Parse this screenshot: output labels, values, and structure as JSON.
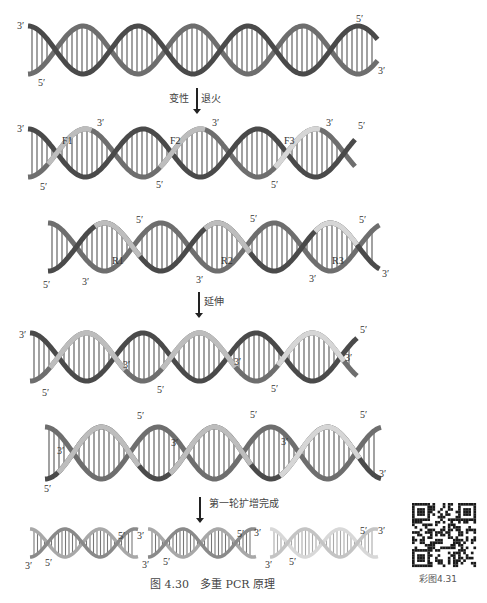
{
  "figure": {
    "caption": "图 4.30　多重 PCR 原理",
    "qr_label": "彩图4.31"
  },
  "steps": [
    {
      "left": "变性",
      "right": "退火"
    },
    {
      "right": "延伸"
    },
    {
      "right": "第一轮扩增完成"
    }
  ],
  "colors": {
    "strand_dark": "#4a4a4a",
    "strand_mid": "#6e6e6e",
    "primer_light": "#bdbdbd",
    "primer_lighter": "#d6d6d6",
    "rung": "#555555"
  },
  "panels": {
    "p1": {
      "labels": [
        "3′",
        "5′",
        "5′",
        "3′"
      ]
    },
    "p2": {
      "labels": [
        "3′",
        "5′",
        "F1",
        "3′",
        "5′",
        "F2",
        "3′",
        "5′",
        "F3",
        "3′",
        "5′"
      ]
    },
    "p3": {
      "labels": [
        "5′",
        "3′",
        "R1",
        "5′",
        "3′",
        "R2",
        "5′",
        "3′",
        "R3",
        "5′",
        "3′"
      ]
    },
    "p4": {
      "labels": [
        "3′",
        "5′",
        "3′",
        "5′",
        "3′",
        "5′",
        "3′",
        "5′"
      ]
    },
    "p5": {
      "labels": [
        "3′",
        "5′",
        "5′",
        "3′",
        "5′",
        "3′",
        "5′",
        "3′"
      ]
    },
    "p6": {
      "labels": [
        "3′",
        "5′",
        "5′",
        "3′",
        "3′",
        "5′",
        "5′",
        "3′",
        "3′",
        "5′",
        "5′",
        "3′"
      ]
    }
  }
}
